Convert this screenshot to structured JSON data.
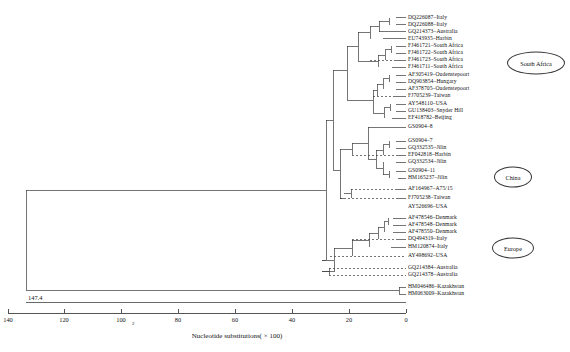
{
  "figure": {
    "type": "phylogenetic-tree",
    "orientation": "right-to-left",
    "root_branch_length_label": "147.4"
  },
  "axis": {
    "caption": "Nucleotide substitutions( × 100)",
    "subscript_marker": "2",
    "ticks": [
      "140",
      "120",
      "100",
      "80",
      "60",
      "40",
      "20",
      "0"
    ],
    "tick_values": [
      140,
      120,
      100,
      80,
      60,
      40,
      20,
      0
    ],
    "range": [
      0,
      147.4
    ],
    "direction": "descending-left-to-right"
  },
  "regions": [
    {
      "name": "south-africa",
      "label": "South Africa"
    },
    {
      "name": "china",
      "label": "China"
    },
    {
      "name": "europe",
      "label": "Europe"
    }
  ],
  "taxa": [
    {
      "accession": "DQ226087",
      "location": "Italy",
      "label": "DQ226087–Italy"
    },
    {
      "accession": "DQ226088",
      "location": "Italy",
      "label": "DQ226088–Italy"
    },
    {
      "accession": "GQ214373",
      "location": "Australia",
      "label": "GQ214373–Australia"
    },
    {
      "accession": "EU743935",
      "location": "Harbin",
      "label": "EU743935–Harbin"
    },
    {
      "accession": "FJ461721",
      "location": "South Africa",
      "label": "FJ461721–South Africa"
    },
    {
      "accession": "FJ461722",
      "location": "South Africa",
      "label": "FJ461722–South Africa"
    },
    {
      "accession": "FJ461723",
      "location": "South Africa",
      "label": "FJ461723–South Africa"
    },
    {
      "accession": "FJ461711",
      "location": "South Africa",
      "label": "FJ461711–South Africa"
    },
    {
      "accession": "AF305419",
      "location": "Oudenstepoort",
      "label": "AF305419–Oudenstepoort"
    },
    {
      "accession": "DQ903854",
      "location": "Hungary",
      "label": "DQ903854–Hungary"
    },
    {
      "accession": "AF378705",
      "location": "Oudenstepoort",
      "label": "AF378705–Oudenstepoort"
    },
    {
      "accession": "FJ705239",
      "location": "Taiwan",
      "label": "FJ705239–Taiwan"
    },
    {
      "accession": "AY548110",
      "location": "USA",
      "label": "AY548110–USA"
    },
    {
      "accession": "GU138403",
      "location": "Snyder Hill",
      "label": "GU138403–Snyder Hill"
    },
    {
      "accession": "EF418782",
      "location": "Beijing",
      "label": "EF418782–Beijing"
    },
    {
      "accession": "GS0904-8",
      "location": "",
      "label": "GS0904–8"
    },
    {
      "accession": "GS0904-7",
      "location": "",
      "label": "GS0904–7"
    },
    {
      "accession": "GQ332535",
      "location": "Jilin",
      "label": "GQ332535–Jilin"
    },
    {
      "accession": "EF042818",
      "location": "Harbin",
      "label": "EF042818–Harbin"
    },
    {
      "accession": "GQ332534",
      "location": "Jilin",
      "label": "GQ332534–Jilin"
    },
    {
      "accession": "GS0904-11",
      "location": "",
      "label": "GS0904–11"
    },
    {
      "accession": "HM165237",
      "location": "Jilin",
      "label": "HM165237–Jilin"
    },
    {
      "accession": "AF164967",
      "location": "A75/15",
      "label": "AF164967–A75/15"
    },
    {
      "accession": "FJ705238",
      "location": "Taiwan",
      "label": "FJ705238–Taiwan"
    },
    {
      "accession": "AY526696",
      "location": "USA",
      "label": "AY526696–USA"
    },
    {
      "accession": "AF478546",
      "location": "Denmark",
      "label": "AF478546–Denmark"
    },
    {
      "accession": "AF478548",
      "location": "Denmark",
      "label": "AF478548–Denmark"
    },
    {
      "accession": "AF478550",
      "location": "Denmark",
      "label": "AF478550–Denmark"
    },
    {
      "accession": "DQ494319",
      "location": "Italy",
      "label": "DQ494319–Italy"
    },
    {
      "accession": "HM120874",
      "location": "Italy",
      "label": "HM120874–Italy"
    },
    {
      "accession": "AY498692",
      "location": "USA",
      "label": "AY498692–USA"
    },
    {
      "accession": "GQ214384",
      "location": "Australia",
      "label": "GQ214384–Australia"
    },
    {
      "accession": "GQ214378",
      "location": "Australia",
      "label": "GQ214378–Australia"
    },
    {
      "accession": "HM046486",
      "location": "Kazakhstan",
      "label": "HM046486–Kazakhstan"
    },
    {
      "accession": "HM063009",
      "location": "Kazakhstan",
      "label": "HM063009–Kazakhstan"
    }
  ]
}
